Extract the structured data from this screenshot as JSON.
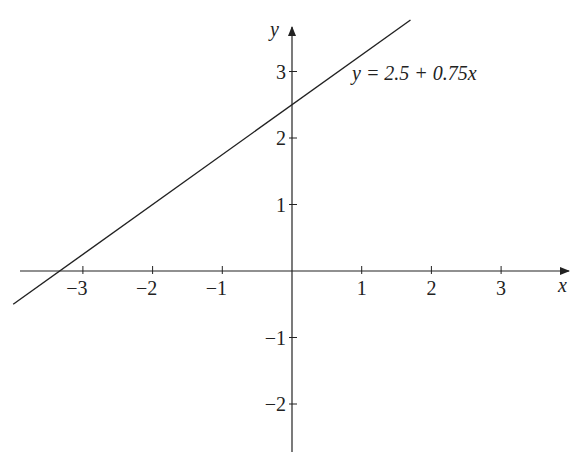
{
  "chart_data": {
    "type": "line",
    "title": "",
    "equation_label": "y = 2.5 + 0.75x",
    "xlabel": "x",
    "ylabel": "y",
    "x_ticks": [
      -3,
      -2,
      -1,
      1,
      2,
      3
    ],
    "y_ticks": [
      -2,
      -1,
      1,
      2,
      3
    ],
    "x_tick_labels": [
      "−3",
      "−2",
      "−1",
      "1",
      "2",
      "3"
    ],
    "y_tick_labels": [
      "−2",
      "−1",
      "1",
      "2",
      "3"
    ],
    "xlim": [
      -4.1,
      4.0
    ],
    "ylim": [
      -2.75,
      3.7
    ],
    "series": [
      {
        "name": "y = 2.5 + 0.75x",
        "intercept": 2.5,
        "slope": 0.75,
        "x": [
          -4.0,
          1.7
        ],
        "y": [
          -0.5,
          3.775
        ]
      }
    ],
    "grid": false,
    "legend": "none",
    "colors": {
      "line": "#222222",
      "axes": "#222222"
    }
  }
}
